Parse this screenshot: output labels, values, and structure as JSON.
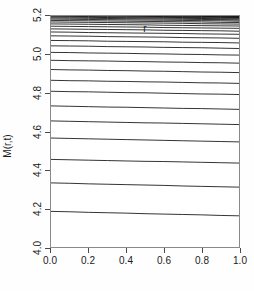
{
  "chart_data": {
    "type": "line",
    "title": "",
    "subtitle": "",
    "xlabel": "r",
    "ylabel": "M(r,t)",
    "xlim": [
      0.0,
      1.0
    ],
    "ylim": [
      4.0,
      5.2
    ],
    "grid": false,
    "legend": null,
    "legend_position": "none",
    "x_ticks": [
      0.0,
      0.2,
      0.4,
      0.6,
      0.8,
      1.0
    ],
    "x_tick_labels": [
      "0.0",
      "0.2",
      "0.4",
      "0.6",
      "0.8",
      "1.0"
    ],
    "y_ticks": [
      4.0,
      4.2,
      4.4,
      4.6,
      4.8,
      5.0,
      5.2
    ],
    "y_tick_labels": [
      "4.0",
      "4.2",
      "4.4",
      "4.6",
      "4.8",
      "5.0",
      "5.2"
    ],
    "line_color": "#000000",
    "line_width": 0.8,
    "x": [
      0.0,
      0.1,
      0.2,
      0.3,
      0.4,
      0.5,
      0.6,
      0.7,
      0.8,
      0.9,
      1.0
    ],
    "series": [
      {
        "name": "t01",
        "y_left": 3.995,
        "y_right": 3.975,
        "values": [
          3.995,
          3.993,
          3.991,
          3.989,
          3.987,
          3.985,
          3.983,
          3.981,
          3.979,
          3.977,
          3.975
        ]
      },
      {
        "name": "t02",
        "y_left": 4.185,
        "y_right": 4.162,
        "values": [
          4.185,
          4.183,
          4.18,
          4.178,
          4.176,
          4.173,
          4.171,
          4.169,
          4.167,
          4.164,
          4.162
        ]
      },
      {
        "name": "t03",
        "y_left": 4.333,
        "y_right": 4.311,
        "values": [
          4.333,
          4.331,
          4.328,
          4.326,
          4.324,
          4.322,
          4.32,
          4.317,
          4.315,
          4.313,
          4.311
        ]
      },
      {
        "name": "t04",
        "y_left": 4.455,
        "y_right": 4.436,
        "values": [
          4.455,
          4.453,
          4.451,
          4.449,
          4.447,
          4.445,
          4.444,
          4.442,
          4.44,
          4.438,
          4.436
        ]
      },
      {
        "name": "t05",
        "y_left": 4.566,
        "y_right": 4.546,
        "values": [
          4.566,
          4.564,
          4.562,
          4.56,
          4.558,
          4.556,
          4.554,
          4.552,
          4.55,
          4.548,
          4.546
        ]
      },
      {
        "name": "t06",
        "y_left": 4.655,
        "y_right": 4.636,
        "values": [
          4.655,
          4.653,
          4.651,
          4.649,
          4.647,
          4.645,
          4.644,
          4.642,
          4.64,
          4.638,
          4.636
        ]
      },
      {
        "name": "t07",
        "y_left": 4.733,
        "y_right": 4.715,
        "values": [
          4.733,
          4.731,
          4.729,
          4.727,
          4.726,
          4.724,
          4.722,
          4.72,
          4.719,
          4.717,
          4.715
        ]
      },
      {
        "name": "t08",
        "y_left": 4.809,
        "y_right": 4.792,
        "values": [
          4.809,
          4.807,
          4.806,
          4.804,
          4.802,
          4.801,
          4.799,
          4.797,
          4.795,
          4.794,
          4.792
        ]
      },
      {
        "name": "t09",
        "y_left": 4.866,
        "y_right": 4.85,
        "values": [
          4.866,
          4.864,
          4.863,
          4.861,
          4.86,
          4.858,
          4.857,
          4.855,
          4.853,
          4.852,
          4.85
        ]
      },
      {
        "name": "t10",
        "y_left": 4.922,
        "y_right": 4.906,
        "values": [
          4.922,
          4.92,
          4.919,
          4.917,
          4.916,
          4.914,
          4.913,
          4.911,
          4.909,
          4.908,
          4.906
        ]
      },
      {
        "name": "t11",
        "y_left": 4.97,
        "y_right": 4.955,
        "values": [
          4.97,
          4.968,
          4.967,
          4.966,
          4.964,
          4.963,
          4.961,
          4.96,
          4.958,
          4.957,
          4.955
        ]
      },
      {
        "name": "t12",
        "y_left": 5.011,
        "y_right": 4.997,
        "values": [
          5.011,
          5.01,
          5.008,
          5.007,
          5.006,
          5.004,
          5.003,
          5.001,
          5.0,
          4.998,
          4.997
        ]
      },
      {
        "name": "t13",
        "y_left": 5.045,
        "y_right": 5.031,
        "values": [
          5.045,
          5.044,
          5.043,
          5.041,
          5.04,
          5.039,
          5.037,
          5.036,
          5.035,
          5.033,
          5.031
        ]
      },
      {
        "name": "t14",
        "y_left": 5.073,
        "y_right": 5.06,
        "values": [
          5.073,
          5.072,
          5.071,
          5.069,
          5.068,
          5.067,
          5.066,
          5.064,
          5.063,
          5.062,
          5.06
        ]
      },
      {
        "name": "t15",
        "y_left": 5.097,
        "y_right": 5.084,
        "values": [
          5.097,
          5.096,
          5.095,
          5.093,
          5.092,
          5.091,
          5.09,
          5.088,
          5.087,
          5.086,
          5.084
        ]
      },
      {
        "name": "t16",
        "y_left": 5.117,
        "y_right": 5.105,
        "values": [
          5.117,
          5.116,
          5.114,
          5.113,
          5.112,
          5.111,
          5.11,
          5.109,
          5.107,
          5.106,
          5.105
        ]
      },
      {
        "name": "t17",
        "y_left": 5.133,
        "y_right": 5.121,
        "values": [
          5.133,
          5.132,
          5.131,
          5.13,
          5.129,
          5.128,
          5.126,
          5.125,
          5.124,
          5.123,
          5.121
        ]
      },
      {
        "name": "t18",
        "y_left": 5.147,
        "y_right": 5.136,
        "values": [
          5.147,
          5.146,
          5.145,
          5.144,
          5.143,
          5.142,
          5.14,
          5.139,
          5.138,
          5.137,
          5.136
        ]
      },
      {
        "name": "t19",
        "y_left": 5.159,
        "y_right": 5.148,
        "values": [
          5.159,
          5.158,
          5.157,
          5.156,
          5.155,
          5.154,
          5.152,
          5.151,
          5.15,
          5.149,
          5.148
        ]
      },
      {
        "name": "t20",
        "y_left": 5.169,
        "y_right": 5.158,
        "values": [
          5.169,
          5.168,
          5.167,
          5.166,
          5.165,
          5.164,
          5.163,
          5.162,
          5.16,
          5.159,
          5.158
        ]
      },
      {
        "name": "t21",
        "y_left": 5.177,
        "y_right": 5.166,
        "values": [
          5.177,
          5.176,
          5.175,
          5.174,
          5.173,
          5.172,
          5.171,
          5.17,
          5.169,
          5.167,
          5.166
        ]
      },
      {
        "name": "t22",
        "y_left": 5.184,
        "y_right": 5.173,
        "values": [
          5.184,
          5.183,
          5.182,
          5.181,
          5.18,
          5.179,
          5.178,
          5.177,
          5.176,
          5.175,
          5.173
        ]
      },
      {
        "name": "t23",
        "y_left": 5.19,
        "y_right": 5.179,
        "values": [
          5.19,
          5.189,
          5.188,
          5.187,
          5.186,
          5.185,
          5.184,
          5.183,
          5.182,
          5.181,
          5.179
        ]
      },
      {
        "name": "t24",
        "y_left": 5.195,
        "y_right": 5.184,
        "values": [
          5.195,
          5.194,
          5.193,
          5.192,
          5.191,
          5.19,
          5.189,
          5.188,
          5.187,
          5.185,
          5.184
        ]
      },
      {
        "name": "t25",
        "y_left": 5.199,
        "y_right": 5.188,
        "values": [
          5.199,
          5.198,
          5.197,
          5.196,
          5.195,
          5.194,
          5.193,
          5.192,
          5.191,
          5.189,
          5.188
        ]
      },
      {
        "name": "t26",
        "y_left": 5.203,
        "y_right": 5.192,
        "values": [
          5.203,
          5.202,
          5.201,
          5.2,
          5.199,
          5.198,
          5.197,
          5.196,
          5.194,
          5.193,
          5.192
        ]
      },
      {
        "name": "t27",
        "y_left": 5.206,
        "y_right": 5.195,
        "values": [
          5.206,
          5.205,
          5.204,
          5.203,
          5.202,
          5.201,
          5.2,
          5.199,
          5.198,
          5.196,
          5.195
        ]
      },
      {
        "name": "t28",
        "y_left": 5.209,
        "y_right": 5.198,
        "values": [
          5.209,
          5.208,
          5.207,
          5.206,
          5.205,
          5.204,
          5.203,
          5.202,
          5.2,
          5.199,
          5.198
        ]
      },
      {
        "name": "t29",
        "y_left": 5.211,
        "y_right": 5.2,
        "values": [
          5.211,
          5.21,
          5.209,
          5.208,
          5.207,
          5.206,
          5.205,
          5.204,
          5.203,
          5.201,
          5.2
        ]
      },
      {
        "name": "t30",
        "y_left": 5.213,
        "y_right": 5.202,
        "values": [
          5.213,
          5.212,
          5.211,
          5.21,
          5.209,
          5.208,
          5.207,
          5.206,
          5.205,
          5.203,
          5.202
        ]
      },
      {
        "name": "t31",
        "y_left": 5.215,
        "y_right": 5.204,
        "values": [
          5.215,
          5.214,
          5.213,
          5.212,
          5.211,
          5.21,
          5.209,
          5.208,
          5.206,
          5.205,
          5.204
        ]
      },
      {
        "name": "t32",
        "y_left": 5.216,
        "y_right": 5.205,
        "values": [
          5.216,
          5.215,
          5.214,
          5.213,
          5.212,
          5.211,
          5.21,
          5.209,
          5.208,
          5.207,
          5.205
        ]
      },
      {
        "name": "t33",
        "y_left": 5.218,
        "y_right": 5.207,
        "values": [
          5.218,
          5.217,
          5.216,
          5.215,
          5.214,
          5.213,
          5.212,
          5.21,
          5.209,
          5.208,
          5.207
        ]
      },
      {
        "name": "t34",
        "y_left": 5.219,
        "y_right": 5.208,
        "values": [
          5.219,
          5.218,
          5.217,
          5.216,
          5.215,
          5.214,
          5.213,
          5.212,
          5.21,
          5.209,
          5.208
        ]
      },
      {
        "name": "t35",
        "y_left": 5.22,
        "y_right": 5.209,
        "values": [
          5.22,
          5.219,
          5.218,
          5.217,
          5.216,
          5.215,
          5.214,
          5.213,
          5.211,
          5.21,
          5.209
        ]
      },
      {
        "name": "t36",
        "y_left": 5.221,
        "y_right": 5.21,
        "values": [
          5.221,
          5.22,
          5.219,
          5.218,
          5.217,
          5.216,
          5.215,
          5.213,
          5.212,
          5.211,
          5.21
        ]
      },
      {
        "name": "t37",
        "y_left": 5.222,
        "y_right": 5.211,
        "values": [
          5.222,
          5.221,
          5.22,
          5.219,
          5.218,
          5.217,
          5.215,
          5.214,
          5.213,
          5.212,
          5.211
        ]
      },
      {
        "name": "t38",
        "y_left": 5.222,
        "y_right": 5.211,
        "values": [
          5.222,
          5.221,
          5.22,
          5.219,
          5.218,
          5.217,
          5.216,
          5.215,
          5.214,
          5.212,
          5.211
        ]
      },
      {
        "name": "t39",
        "y_left": 5.223,
        "y_right": 5.212,
        "values": [
          5.223,
          5.222,
          5.221,
          5.22,
          5.219,
          5.218,
          5.217,
          5.216,
          5.214,
          5.213,
          5.212
        ]
      },
      {
        "name": "t40",
        "y_left": 5.224,
        "y_right": 5.213,
        "values": [
          5.224,
          5.223,
          5.222,
          5.221,
          5.22,
          5.219,
          5.217,
          5.216,
          5.215,
          5.214,
          5.213
        ]
      },
      {
        "name": "t41",
        "y_left": 5.224,
        "y_right": 5.213,
        "values": [
          5.224,
          5.223,
          5.222,
          5.221,
          5.22,
          5.219,
          5.218,
          5.217,
          5.216,
          5.214,
          5.213
        ]
      },
      {
        "name": "t42",
        "y_left": 5.225,
        "y_right": 5.214,
        "values": [
          5.225,
          5.224,
          5.223,
          5.222,
          5.221,
          5.22,
          5.218,
          5.217,
          5.216,
          5.215,
          5.214
        ]
      },
      {
        "name": "t43",
        "y_left": 5.225,
        "y_right": 5.214,
        "values": [
          5.225,
          5.224,
          5.223,
          5.222,
          5.221,
          5.22,
          5.219,
          5.218,
          5.216,
          5.215,
          5.214
        ]
      },
      {
        "name": "t44",
        "y_left": 5.226,
        "y_right": 5.215,
        "values": [
          5.226,
          5.225,
          5.224,
          5.223,
          5.222,
          5.22,
          5.219,
          5.218,
          5.217,
          5.216,
          5.215
        ]
      },
      {
        "name": "t45",
        "y_left": 5.226,
        "y_right": 5.215,
        "values": [
          5.226,
          5.225,
          5.224,
          5.223,
          5.222,
          5.221,
          5.219,
          5.218,
          5.217,
          5.216,
          5.215
        ]
      },
      {
        "name": "t46",
        "y_left": 5.226,
        "y_right": 5.215,
        "values": [
          5.226,
          5.225,
          5.224,
          5.223,
          5.222,
          5.221,
          5.22,
          5.219,
          5.217,
          5.216,
          5.215
        ]
      },
      {
        "name": "t47",
        "y_left": 5.227,
        "y_right": 5.216,
        "values": [
          5.227,
          5.226,
          5.225,
          5.224,
          5.222,
          5.221,
          5.22,
          5.219,
          5.218,
          5.217,
          5.216
        ]
      },
      {
        "name": "t48",
        "y_left": 5.227,
        "y_right": 5.216,
        "values": [
          5.227,
          5.226,
          5.225,
          5.224,
          5.223,
          5.221,
          5.22,
          5.219,
          5.218,
          5.217,
          5.216
        ]
      },
      {
        "name": "t49",
        "y_left": 5.227,
        "y_right": 5.216,
        "values": [
          5.227,
          5.226,
          5.225,
          5.224,
          5.223,
          5.222,
          5.22,
          5.219,
          5.218,
          5.217,
          5.216
        ]
      },
      {
        "name": "t50",
        "y_left": 5.228,
        "y_right": 5.217,
        "values": [
          5.228,
          5.227,
          5.225,
          5.224,
          5.223,
          5.222,
          5.221,
          5.22,
          5.218,
          5.217,
          5.217
        ]
      }
    ]
  }
}
